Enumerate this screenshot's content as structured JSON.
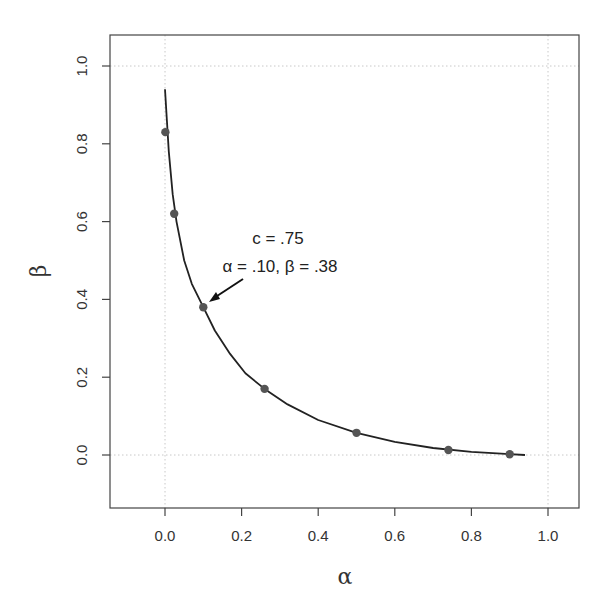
{
  "chart_data": {
    "type": "line",
    "title": "",
    "xlabel": "α",
    "ylabel": "β",
    "xlim": [
      -0.14,
      1.08
    ],
    "ylim": [
      -0.14,
      1.08
    ],
    "x_ticks": [
      "0.0",
      "0.2",
      "0.4",
      "0.6",
      "0.8",
      "1.0"
    ],
    "y_ticks": [
      "0.0",
      "0.2",
      "0.4",
      "0.6",
      "0.8",
      "1.0"
    ],
    "grid": {
      "vertical": [
        0.0,
        1.0
      ],
      "horizontal": [
        0.0,
        1.0
      ],
      "style": "dotted"
    },
    "legend": null,
    "series": [
      {
        "name": "curve",
        "kind": "line",
        "color": "#222222",
        "x": [
          0.0,
          0.005,
          0.01,
          0.02,
          0.03,
          0.05,
          0.07,
          0.1,
          0.13,
          0.17,
          0.21,
          0.26,
          0.32,
          0.4,
          0.5,
          0.6,
          0.7,
          0.8,
          0.9,
          0.94
        ],
        "y": [
          0.94,
          0.86,
          0.78,
          0.67,
          0.6,
          0.5,
          0.44,
          0.38,
          0.32,
          0.26,
          0.21,
          0.17,
          0.13,
          0.09,
          0.057,
          0.034,
          0.018,
          0.008,
          0.002,
          0.0
        ]
      },
      {
        "name": "points",
        "kind": "scatter",
        "color": "#555555",
        "x": [
          0.001,
          0.024,
          0.1,
          0.26,
          0.5,
          0.74,
          0.9
        ],
        "y": [
          0.83,
          0.62,
          0.38,
          0.17,
          0.057,
          0.013,
          0.002
        ]
      }
    ],
    "annotations": [
      {
        "text_line1": "c = .75",
        "text_line2": "α = .10,  β = .38",
        "arrow_to": [
          0.1,
          0.38
        ]
      }
    ]
  },
  "annotation": {
    "line1": "c = .75",
    "line2": "α = .10,  β = .38"
  },
  "axes": {
    "xlabel": "α",
    "ylabel": "β"
  }
}
